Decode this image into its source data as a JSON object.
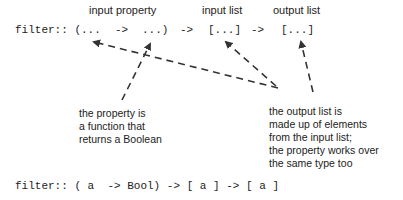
{
  "labels": {
    "input_property": "input property",
    "input_list": "input list",
    "output_list": "output list"
  },
  "signature_top": {
    "prefix": "filter:: (",
    "arg": "...",
    "arrow1": "->",
    "ret": "...)",
    "arrow2": "->",
    "input_list": "[...]",
    "arrow3": "->",
    "output_list": "[...]"
  },
  "notes": {
    "property": [
      "the property is",
      "a function that",
      "returns a Boolean"
    ],
    "output": [
      "the output list is",
      "made up of elements",
      "from the input list;",
      "the property works over",
      "the same type too"
    ]
  },
  "signature_bottom": "filter:: ( a  -> Bool) -> [ a ] -> [ a ]",
  "colors": {
    "text": "#222222",
    "arrow": "#333333"
  }
}
